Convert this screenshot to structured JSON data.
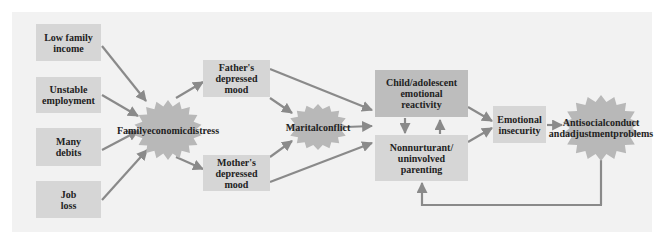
{
  "diagram": {
    "colors": {
      "panel": "#f2f2f2",
      "box_light": "#d6d6d6",
      "box_dark": "#bdbdbd",
      "burst": "#b8b8b8",
      "arrow": "#8a8a8a"
    },
    "nodes": {
      "low_income": "Low family income",
      "unstable_employment": "Unstable employment",
      "many_debits": "Many debits",
      "job_loss": "Job loss",
      "family_distress": "Family economic distress",
      "father_mood": "Father's depressed mood",
      "mother_mood": "Mother's depressed mood",
      "marital_conflict": "Marital conflict",
      "child_reactivity": "Child/adolescent emotional reactivity",
      "parenting": "Nonnurturant/ uninvolved parenting",
      "emotional_insecurity": "Emotional insecurity",
      "antisocial": "Antisocial conduct and adjustment problems"
    },
    "labels": {
      "low_income": [
        "Low family",
        "income"
      ],
      "unstable_employment": [
        "Unstable",
        "employment"
      ],
      "many_debits": [
        "Many",
        "debits"
      ],
      "job_loss": [
        "Job",
        "loss"
      ],
      "family_distress": [
        "Family",
        "economic",
        "distress"
      ],
      "father_mood": [
        "Father's",
        "depressed",
        "mood"
      ],
      "mother_mood": [
        "Mother's",
        "depressed",
        "mood"
      ],
      "marital_conflict": [
        "Marital",
        "conflict"
      ],
      "child_reactivity": [
        "Child/adolescent",
        "emotional",
        "reactivity"
      ],
      "parenting": [
        "Nonnurturant/",
        "uninvolved",
        "parenting"
      ],
      "emotional_insecurity": [
        "Emotional",
        "insecurity"
      ],
      "antisocial": [
        "Antisocial",
        "conduct and",
        "adjustment",
        "problems"
      ]
    },
    "edges": [
      [
        "low_income",
        "family_distress"
      ],
      [
        "unstable_employment",
        "family_distress"
      ],
      [
        "many_debits",
        "family_distress"
      ],
      [
        "job_loss",
        "family_distress"
      ],
      [
        "family_distress",
        "father_mood"
      ],
      [
        "family_distress",
        "mother_mood"
      ],
      [
        "father_mood",
        "marital_conflict"
      ],
      [
        "mother_mood",
        "marital_conflict"
      ],
      [
        "father_mood",
        "child_reactivity"
      ],
      [
        "mother_mood",
        "parenting"
      ],
      [
        "marital_conflict",
        "child_reactivity"
      ],
      [
        "child_reactivity",
        "parenting"
      ],
      [
        "parenting",
        "child_reactivity"
      ],
      [
        "child_reactivity",
        "emotional_insecurity"
      ],
      [
        "parenting",
        "emotional_insecurity"
      ],
      [
        "emotional_insecurity",
        "antisocial"
      ],
      [
        "antisocial",
        "parenting"
      ]
    ]
  }
}
